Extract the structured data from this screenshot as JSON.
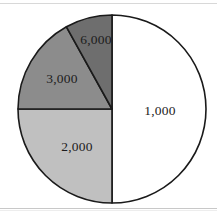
{
  "figure": {
    "title": "",
    "background_color": "#ffffff",
    "outline_color": "#1a1a1a"
  },
  "chart_data": {
    "type": "pie",
    "title": "",
    "xlabel": "",
    "ylabel": "",
    "legend": "none",
    "labels_position": "inside-slices",
    "start_angle_deg": 0,
    "direction": "clockwise",
    "center": {
      "x": 112,
      "y": 109
    },
    "radius": 94,
    "categories": [
      "1,000",
      "2,000",
      "3,000",
      "6,000"
    ],
    "values": [
      50,
      25,
      17,
      8
    ],
    "total": 100,
    "slices": [
      {
        "label": "1,000",
        "value": 50,
        "percent": 50,
        "color": "#ffffff",
        "start_deg": 0,
        "end_deg": 180,
        "label_x": 160,
        "label_y": 112
      },
      {
        "label": "2,000",
        "value": 25,
        "percent": 25,
        "color": "#c0c0c0",
        "start_deg": 180,
        "end_deg": 270,
        "label_x": 77,
        "label_y": 148
      },
      {
        "label": "3,000",
        "value": 17,
        "percent": 17,
        "color": "#8c8c8c",
        "start_deg": 270,
        "end_deg": 331,
        "label_x": 62,
        "label_y": 80
      },
      {
        "label": "6,000",
        "value": 8,
        "percent": 8,
        "color": "#6e6e6e",
        "start_deg": 331,
        "end_deg": 360,
        "label_x": 96,
        "label_y": 41
      }
    ]
  }
}
